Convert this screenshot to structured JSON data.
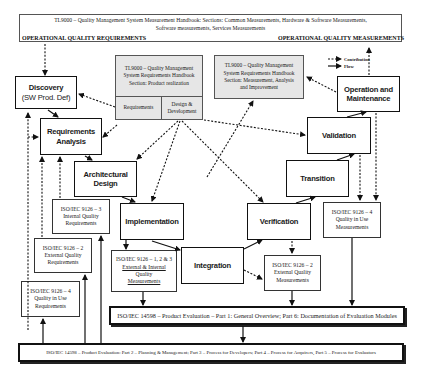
{
  "header": {
    "title_line1": "TL9000 – Quality Management System Measurement Handbook: Sections: Common Measurements, Hardware & Software Measurements,",
    "title_line2": "Software measurements, Services Measurements",
    "left_label": "OPERATIONAL QUALITY REQUIREMENTS",
    "right_label": "OPERATIONAL QUALITY MEASUREMENTS"
  },
  "legend": {
    "contribution": "Contribution",
    "flow": "Flow"
  },
  "tl9000_boxes": {
    "requirements_handbook": {
      "line1": "TL9000 – Quality Management",
      "line2": "System Requirements Handbook",
      "line3": "Section: Product realization",
      "cell_left": "Requirements",
      "cell_right_line1": "Design &",
      "cell_right_line2": "Development"
    },
    "measurement_handbook": {
      "line1": "TL9000 – Quality Management",
      "line2": "System Requirements Handbook",
      "line3": "Section: Measurement, Analysis",
      "line4": "and Improvement"
    }
  },
  "process_steps": {
    "discovery": {
      "line1": "Discovery",
      "line2": "(SW Prod. Def)"
    },
    "requirements_analysis": {
      "line1": "Requirements",
      "line2": "Analysis"
    },
    "architectural_design": {
      "line1": "Architectural",
      "line2": "Design"
    },
    "implementation": {
      "line1": "Implementation"
    },
    "integration": {
      "line1": "Integration"
    },
    "verification": {
      "line1": "Verification"
    },
    "transition": {
      "line1": "Transition"
    },
    "validation": {
      "line1": "Validation"
    },
    "operation_maintenance": {
      "line1": "Operation and",
      "line2": "Maintenance"
    }
  },
  "standards": {
    "internal_quality_req": {
      "line1": "ISO/IEC 9126 – 3",
      "line2": "Internal Quality",
      "line3": "Requirements"
    },
    "external_quality_req": {
      "line1": "ISO/IEC 9126 – 2",
      "line2": "External Quality",
      "line3": "Requirements"
    },
    "quality_in_use_req": {
      "line1": "ISO/IEC 9126 – 4",
      "line2": "Quality in Use",
      "line3": "Requirements"
    },
    "ext_int_quality_meas": {
      "line1": "ISO/IEC 9126 – 1, 2 & 3",
      "line2": "External & Internal",
      "line3": "Quality",
      "line4": "Measurements"
    },
    "external_quality_meas": {
      "line1": "ISO/IEC 9126 – 2",
      "line2": "External Quality",
      "line3": "Measurements"
    },
    "quality_in_use_meas": {
      "line1": "ISO/IEC 9126 – 4",
      "line2": "Quality in Use",
      "line3": "Measurements"
    }
  },
  "evaluation_bars": {
    "part1_6": "ISO/IEC 14598 – Product Evaluation – Part 1: General Overview; Part 6: Documentation of Evaluation Modules",
    "part2_5": "ISO/IEC 14598 – Product Evaluation: Part 2 – Planning & Management; Part 3 – Process for Developers; Part 4 – Process for Acquirers, Part 5 – Process for Evaluators"
  },
  "colors": {
    "line": "#111111",
    "tl9000_fill": "#e6e6e6",
    "background": "#ffffff"
  }
}
